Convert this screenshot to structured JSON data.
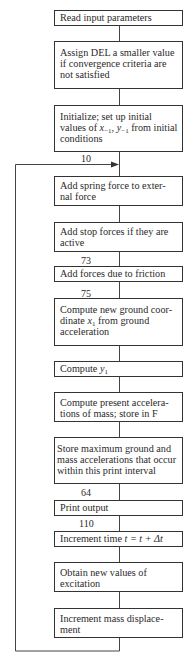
{
  "flowchart": {
    "steps": [
      {
        "id": "read-input",
        "text": "Read input parameters"
      },
      {
        "id": "assign-del",
        "text": "Assign DEL a smaller value if convergence criteria are not satisfied"
      },
      {
        "id": "initialize",
        "text_a": "Initialize; set up initial values of ",
        "var_x": "x",
        "sub_x": "−1",
        "sep": ", ",
        "var_y": "y",
        "sub_y": "−1",
        "text_b": " from initial conditions"
      },
      {
        "id": "spring-force",
        "text": "Add spring force to exter-nal force"
      },
      {
        "id": "stop-forces",
        "text": "Add stop forces if they are active"
      },
      {
        "id": "friction",
        "text": "Add forces due to friction"
      },
      {
        "id": "ground-coord",
        "text_a": "Compute new ground coor-dinate ",
        "var": "x",
        "sub": "1",
        "text_b": " from ground acceleration"
      },
      {
        "id": "compute-y1",
        "text_a": "Compute ",
        "var": "y",
        "sub": "1"
      },
      {
        "id": "present-accel",
        "text": "Compute present accelera-tions of mass; store in F"
      },
      {
        "id": "store-max",
        "text": "Store maximum ground and mass accelerations that occur within this print interval"
      },
      {
        "id": "print-output",
        "text": "Print output"
      },
      {
        "id": "increment-time",
        "text_a": "Increment time ",
        "expr": "t = t + Δt"
      },
      {
        "id": "excitation",
        "text": "Obtain new values of excitation"
      },
      {
        "id": "mass-displacement",
        "text": "Increment mass displace-ment"
      }
    ],
    "labels": {
      "l10": "10",
      "l73": "73",
      "l75": "75",
      "l64": "64",
      "l110": "110"
    },
    "colors": {
      "line": "#333333",
      "background": "#ffffff"
    }
  }
}
